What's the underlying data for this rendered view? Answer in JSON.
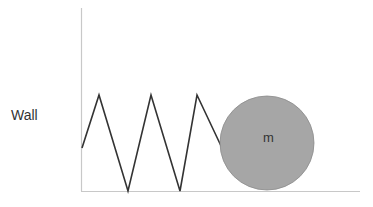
{
  "diagram": {
    "wall_label": "Wall",
    "mass_label": "m",
    "colors": {
      "wall_line": "#c8c8c8",
      "floor_line": "#c8c8c8",
      "spring": "#333333",
      "mass_fill": "#a6a6a6",
      "mass_stroke": "#8c8c8c",
      "text": "#333333"
    },
    "spring_points": "82,148 99,95 128,191 151,95 180,191 197,95 222,148",
    "mass": {
      "cx": 267,
      "cy": 143,
      "r": 47
    }
  }
}
